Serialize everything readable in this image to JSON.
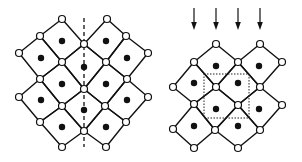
{
  "figure": {
    "width": 302,
    "height": 162,
    "colors": {
      "line": "#111111",
      "background": "#ffffff",
      "node_fill": "#ffffff",
      "dot_fill": "#111111"
    },
    "panels": [
      {
        "name": "left-lattice-mirror",
        "description": "Corner-sharing square lattice with vertical dashed mirror plane",
        "node_radius": 3.5,
        "dot_radius": 3.2,
        "squares": [
          {
            "center": [
              62,
              41
            ],
            "corners": [
              [
                62,
                19
              ],
              [
                84,
                44
              ],
              [
                62,
                62
              ],
              [
                40,
                36
              ]
            ]
          },
          {
            "center": [
              106,
              41
            ],
            "corners": [
              [
                107,
                19
              ],
              [
                126,
                36
              ],
              [
                106,
                62
              ],
              [
                84,
                44
              ]
            ]
          },
          {
            "center": [
              41,
              58
            ],
            "corners": [
              [
                40,
                36
              ],
              [
                62,
                62
              ],
              [
                40,
                79
              ],
              [
                19,
                53
              ]
            ]
          },
          {
            "center": [
              84,
              67
            ],
            "corners": [
              [
                84,
                44
              ],
              [
                106,
                62
              ],
              [
                84,
                89
              ],
              [
                62,
                62
              ]
            ]
          },
          {
            "center": [
              127,
              58
            ],
            "corners": [
              [
                126,
                36
              ],
              [
                148,
                53
              ],
              [
                127,
                79
              ],
              [
                106,
                62
              ]
            ]
          },
          {
            "center": [
              62,
              84
            ],
            "corners": [
              [
                62,
                62
              ],
              [
                84,
                89
              ],
              [
                62,
                106
              ],
              [
                40,
                79
              ]
            ]
          },
          {
            "center": [
              106,
              84
            ],
            "corners": [
              [
                106,
                62
              ],
              [
                127,
                79
              ],
              [
                105,
                106
              ],
              [
                84,
                89
              ]
            ]
          },
          {
            "center": [
              41,
              100
            ],
            "corners": [
              [
                40,
                79
              ],
              [
                62,
                106
              ],
              [
                40,
                122
              ],
              [
                19,
                97
              ]
            ]
          },
          {
            "center": [
              84,
              110
            ],
            "corners": [
              [
                84,
                89
              ],
              [
                105,
                106
              ],
              [
                84,
                131
              ],
              [
                62,
                106
              ]
            ]
          },
          {
            "center": [
              127,
              100
            ],
            "corners": [
              [
                127,
                79
              ],
              [
                148,
                97
              ],
              [
                126,
                122
              ],
              [
                105,
                106
              ]
            ]
          },
          {
            "center": [
              62,
              127
            ],
            "corners": [
              [
                62,
                106
              ],
              [
                84,
                131
              ],
              [
                62,
                147
              ],
              [
                40,
                122
              ]
            ]
          },
          {
            "center": [
              106,
              127
            ],
            "corners": [
              [
                105,
                106
              ],
              [
                126,
                122
              ],
              [
                106,
                147
              ],
              [
                84,
                131
              ]
            ]
          }
        ],
        "mirror_line": {
          "x1": 84,
          "y1": 18,
          "x2": 84,
          "y2": 147
        }
      },
      {
        "name": "right-lattice-cell",
        "description": "Corner-sharing square lattice with dotted unit cell and projection arrows",
        "node_radius": 3.5,
        "dot_radius": 3.2,
        "squares": [
          {
            "center": [
              216,
              66
            ],
            "corners": [
              [
                216,
                44
              ],
              [
                238,
                62
              ],
              [
                216,
                87
              ],
              [
                194,
                62
              ]
            ]
          },
          {
            "center": [
              259,
              66
            ],
            "corners": [
              [
                260,
                44
              ],
              [
                282,
                62
              ],
              [
                260,
                87
              ],
              [
                238,
                62
              ]
            ]
          },
          {
            "center": [
              194,
              83
            ],
            "corners": [
              [
                194,
                62
              ],
              [
                216,
                87
              ],
              [
                194,
                104
              ],
              [
                173,
                87
              ]
            ]
          },
          {
            "center": [
              238,
              83
            ],
            "corners": [
              [
                238,
                62
              ],
              [
                260,
                87
              ],
              [
                238,
                105
              ],
              [
                216,
                87
              ]
            ]
          },
          {
            "center": [
              216,
              109
            ],
            "corners": [
              [
                216,
                87
              ],
              [
                238,
                105
              ],
              [
                215,
                130
              ],
              [
                194,
                104
              ]
            ]
          },
          {
            "center": [
              259,
              109
            ],
            "corners": [
              [
                260,
                87
              ],
              [
                282,
                105
              ],
              [
                260,
                130
              ],
              [
                238,
                105
              ]
            ]
          },
          {
            "center": [
              194,
              126
            ],
            "corners": [
              [
                194,
                104
              ],
              [
                215,
                130
              ],
              [
                194,
                148
              ],
              [
                173,
                129
              ]
            ]
          },
          {
            "center": [
              238,
              126
            ],
            "corners": [
              [
                238,
                105
              ],
              [
                260,
                130
              ],
              [
                238,
                148
              ],
              [
                215,
                130
              ]
            ]
          }
        ],
        "unit_cell": {
          "x": 204,
          "y": 74,
          "w": 45,
          "h": 44
        },
        "arrows": [
          {
            "x": 194,
            "y1": 8,
            "y2": 30
          },
          {
            "x": 216,
            "y1": 8,
            "y2": 30
          },
          {
            "x": 238,
            "y1": 8,
            "y2": 30
          },
          {
            "x": 260,
            "y1": 8,
            "y2": 30
          }
        ]
      }
    ]
  }
}
